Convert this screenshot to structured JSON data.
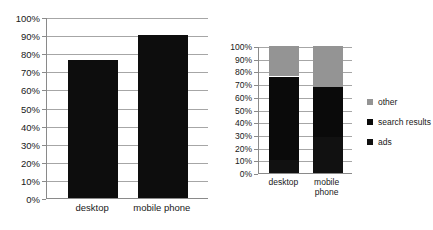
{
  "chart_data": [
    {
      "id": "left",
      "type": "bar",
      "title": "",
      "xlabel": "",
      "ylabel": "",
      "categories": [
        "desktop",
        "mobile phone"
      ],
      "values": [
        76,
        90
      ],
      "ylim": [
        0,
        100
      ],
      "yticks": [
        "0%",
        "10%",
        "20%",
        "30%",
        "40%",
        "50%",
        "60%",
        "70%",
        "80%",
        "90%",
        "100%"
      ],
      "ytick_values": [
        0,
        10,
        20,
        30,
        40,
        50,
        60,
        70,
        80,
        90,
        100
      ],
      "grid": true,
      "legend": false,
      "bar_color": "#0d0d0d"
    },
    {
      "id": "right",
      "type": "bar",
      "stacked": true,
      "title": "",
      "xlabel": "",
      "ylabel": "",
      "categories": [
        "desktop",
        "mobile\nphone"
      ],
      "ylim": [
        0,
        100
      ],
      "yticks": [
        "0%",
        "10%",
        "20%",
        "30%",
        "40%",
        "50%",
        "60%",
        "70%",
        "80%",
        "90%",
        "100%"
      ],
      "ytick_values": [
        0,
        10,
        20,
        30,
        40,
        50,
        60,
        70,
        80,
        90,
        100
      ],
      "grid": true,
      "legend": true,
      "legend_position": "right",
      "series": [
        {
          "name": "ads",
          "values": [
            10,
            28
          ],
          "color": "#111111"
        },
        {
          "name": "search results",
          "values": [
            66,
            40
          ],
          "color": "#0a0a0a"
        },
        {
          "name": "other",
          "values": [
            24,
            32
          ],
          "color": "#949494"
        }
      ],
      "legend_order": [
        "other",
        "search results",
        "ads"
      ]
    }
  ],
  "legend": {
    "items": [
      {
        "label": "other",
        "color": "#949494"
      },
      {
        "label": "search results",
        "color": "#0a0a0a"
      },
      {
        "label": "ads",
        "color": "#111111"
      }
    ]
  }
}
